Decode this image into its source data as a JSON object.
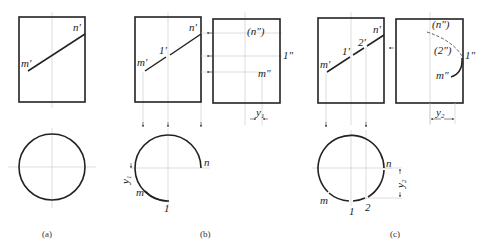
{
  "figures": [
    {
      "caption": "(a)",
      "front_labels": {
        "m": "m'",
        "n": "n'"
      },
      "top_labels": {}
    },
    {
      "caption": "(b)",
      "front_labels": {
        "m": "m'",
        "n": "n'",
        "p1": "1'"
      },
      "side_labels": {
        "n": "(n\")",
        "m": "m\"",
        "p1": "1\""
      },
      "top_labels": {
        "n": "n",
        "m": "m",
        "p1": "1"
      },
      "dimension": "y",
      "dimension_sub": "1"
    },
    {
      "caption": "(c)",
      "front_labels": {
        "m": "m'",
        "n": "n'",
        "p1": "1'",
        "p2": "2'"
      },
      "side_labels": {
        "n": "(n\")",
        "p2": "(2\")",
        "p1": "1\"",
        "m": "m\""
      },
      "top_labels": {
        "n": "n",
        "m": "m",
        "p1": "1",
        "p2": "2"
      },
      "dimension": "y",
      "dimension_sub": "2"
    }
  ]
}
